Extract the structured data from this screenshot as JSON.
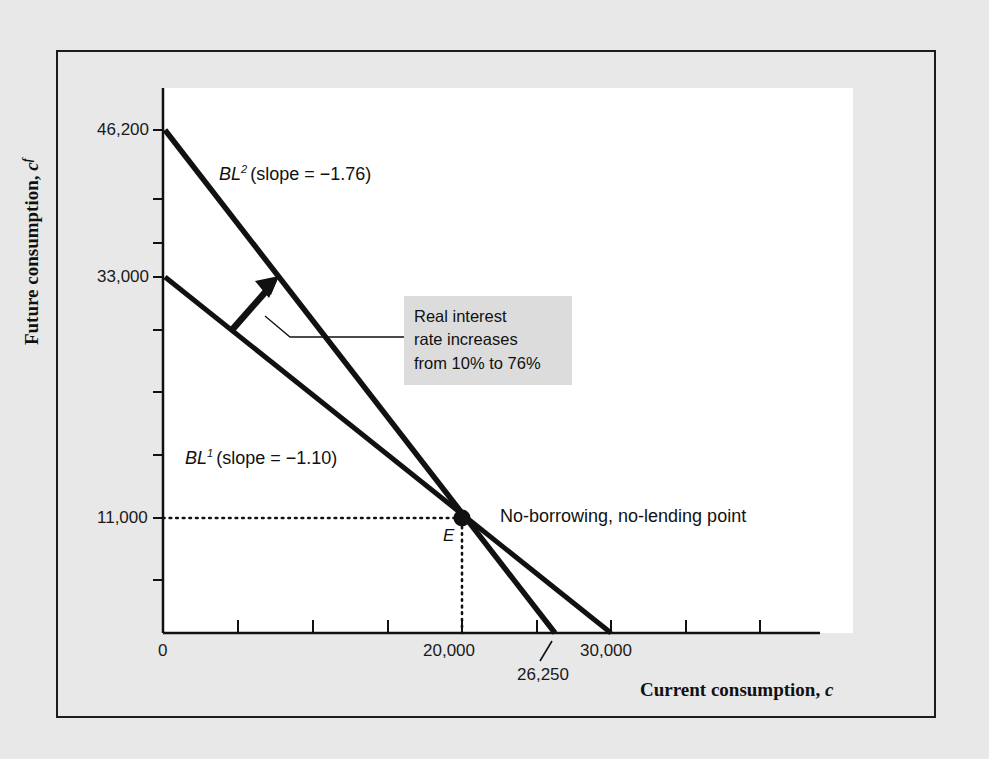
{
  "figure": {
    "background_color": "#e8e8e8",
    "plot_background_color": "#ffffff",
    "line_color": "#111111",
    "annotation_background": "#dcdcdc"
  },
  "axes": {
    "y_title": "Future consumption, c",
    "y_title_sup": "f",
    "x_title": "Current consumption, c",
    "x_title_italic": "c"
  },
  "labels": {
    "bl2_name": "BL",
    "bl2_sup": "2",
    "bl2_slope_text": "(slope = −1.76)",
    "bl1_name": "BL",
    "bl1_sup": "1",
    "bl1_slope_text": "(slope = −1.10)",
    "point_e": "E",
    "no_borrowing_point": "No-borrowing, no-lending point"
  },
  "annotation": {
    "line1": "Real interest",
    "line2": "rate increases",
    "line3": "from 10% to 76%"
  },
  "ticks": {
    "y": [
      "46,200",
      "33,000",
      "11,000"
    ],
    "x": [
      "0",
      "20,000",
      "26,250",
      "30,000"
    ]
  },
  "chart_data": {
    "type": "line",
    "title": "",
    "xlabel": "Current consumption, c",
    "ylabel": "Future consumption, c^f",
    "xlim": [
      0,
      34000
    ],
    "ylim": [
      0,
      55000
    ],
    "grid": false,
    "legend": "inline-labels",
    "x_ticks": [
      0,
      20000,
      26250,
      30000
    ],
    "y_ticks": [
      11000,
      33000,
      46200
    ],
    "series": [
      {
        "name": "BL1",
        "label": "BL^1 (slope = -1.10)",
        "slope": -1.1,
        "real_interest_rate_pct": 10,
        "vertical_intercept": 33000,
        "horizontal_intercept": 30000,
        "x": [
          0,
          30000
        ],
        "y": [
          33000,
          0
        ]
      },
      {
        "name": "BL2",
        "label": "BL^2 (slope = -1.76)",
        "slope": -1.76,
        "real_interest_rate_pct": 76,
        "vertical_intercept": 46200,
        "horizontal_intercept": 26250,
        "x": [
          0,
          26250
        ],
        "y": [
          46200,
          0
        ]
      }
    ],
    "points": [
      {
        "name": "E",
        "label": "No-borrowing, no-lending point",
        "x": 20000,
        "y": 11000
      }
    ],
    "annotations": [
      {
        "text": "Real interest rate increases from 10% to 76%",
        "type": "arrow-callout"
      }
    ]
  }
}
